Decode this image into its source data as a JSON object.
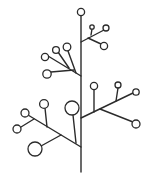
{
  "diagram": {
    "type": "tree-branch-icon",
    "colors": {
      "stroke": "#2b2b2b",
      "background": "#ffffff",
      "node_fill": "#ffffff"
    },
    "stem": {
      "x": 81,
      "y1": 16,
      "y2": 172
    },
    "branches": [
      {
        "id": "upper-right",
        "from": [
          81,
          42
        ],
        "segments": [
          [
            81,
            42,
            104,
            30
          ],
          [
            91,
            35,
            92,
            29
          ],
          [
            88,
            38,
            101,
            44
          ]
        ]
      },
      {
        "id": "upper-left",
        "from": [
          81,
          76
        ],
        "segments": [
          [
            81,
            76,
            48,
            56
          ],
          [
            76,
            73,
            68,
            51
          ],
          [
            69,
            68,
            58,
            52
          ],
          [
            74,
            70,
            51,
            72
          ]
        ]
      },
      {
        "id": "lower-right",
        "from": [
          81,
          118
        ],
        "segments": [
          [
            81,
            118,
            133,
            93
          ],
          [
            94,
            112,
            94,
            89
          ],
          [
            116,
            101,
            118,
            88
          ],
          [
            100,
            109,
            133,
            122
          ]
        ]
      },
      {
        "id": "lower-left",
        "from": [
          81,
          147
        ],
        "segments": [
          [
            81,
            147,
            28,
            115
          ],
          [
            76,
            143,
            73,
            115
          ],
          [
            47,
            127,
            45,
            108
          ],
          [
            61,
            135,
            41,
            146
          ],
          [
            34,
            119,
            21,
            127
          ]
        ]
      }
    ],
    "nodes": [
      {
        "cx": 81,
        "cy": 12,
        "r": 3.6
      },
      {
        "cx": 92,
        "cy": 27,
        "r": 2.2
      },
      {
        "cx": 106,
        "cy": 28,
        "r": 3.0
      },
      {
        "cx": 104,
        "cy": 46,
        "r": 3.6
      },
      {
        "cx": 67,
        "cy": 47,
        "r": 3.8
      },
      {
        "cx": 56,
        "cy": 50,
        "r": 3.4
      },
      {
        "cx": 45,
        "cy": 57,
        "r": 3.6
      },
      {
        "cx": 47,
        "cy": 74,
        "r": 4.2
      },
      {
        "cx": 94,
        "cy": 86,
        "r": 3.6
      },
      {
        "cx": 118,
        "cy": 85,
        "r": 3.0
      },
      {
        "cx": 136,
        "cy": 92,
        "r": 3.2
      },
      {
        "cx": 136,
        "cy": 124,
        "r": 4.0
      },
      {
        "cx": 44,
        "cy": 104,
        "r": 4.4
      },
      {
        "cx": 72,
        "cy": 108,
        "r": 7.0
      },
      {
        "cx": 25,
        "cy": 113,
        "r": 4.0
      },
      {
        "cx": 17,
        "cy": 129,
        "r": 4.0
      },
      {
        "cx": 35,
        "cy": 149,
        "r": 7.0
      }
    ]
  }
}
